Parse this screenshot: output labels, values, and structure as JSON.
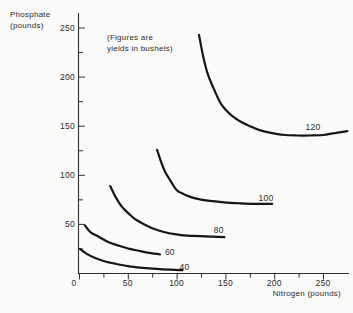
{
  "background": "#fbfbf9",
  "colors": {
    "curve": "#161616",
    "axis": "#2e2e2e",
    "text": "#2b2b2b"
  },
  "chart_data": {
    "type": "line",
    "annotation": [
      "(Figures are",
      "yields in bushels)"
    ],
    "x_axis": {
      "title": "Nitrogen (pounds)",
      "min": 0,
      "max": 277,
      "major_ticks": [
        0,
        50,
        100,
        150,
        200,
        250
      ],
      "minor_tick_step": 25
    },
    "y_axis": {
      "title": [
        "Phosphate",
        "(pounds)"
      ],
      "min": 0,
      "max": 265,
      "major_ticks": [
        50,
        100,
        150,
        200,
        250
      ],
      "minor_tick_step": 25
    },
    "series": [
      {
        "label": "40",
        "yield_bushels": 40,
        "label_pos": [
          103,
          3.5
        ],
        "points": [
          [
            1,
            25
          ],
          [
            8,
            20
          ],
          [
            16,
            16
          ],
          [
            26,
            12.5
          ],
          [
            37,
            10
          ],
          [
            50,
            7.5
          ],
          [
            62,
            6
          ],
          [
            83,
            4.5
          ],
          [
            106,
            3.5
          ]
        ]
      },
      {
        "label": "60",
        "yield_bushels": 60,
        "label_pos": [
          88,
          19
        ],
        "points": [
          [
            6,
            49
          ],
          [
            12,
            42
          ],
          [
            21,
            37
          ],
          [
            31,
            31.5
          ],
          [
            42,
            28
          ],
          [
            52,
            25
          ],
          [
            62,
            23
          ],
          [
            72,
            21
          ],
          [
            83,
            19.5
          ]
        ]
      },
      {
        "label": "80",
        "yield_bushels": 80,
        "label_pos": [
          138,
          41
        ],
        "points": [
          [
            32,
            89
          ],
          [
            38,
            77
          ],
          [
            44,
            68
          ],
          [
            51,
            61
          ],
          [
            58,
            55
          ],
          [
            68,
            49.5
          ],
          [
            78,
            45
          ],
          [
            88,
            42
          ],
          [
            98,
            40
          ],
          [
            111,
            38.5
          ],
          [
            124,
            38
          ],
          [
            149,
            37
          ]
        ]
      },
      {
        "label": "100",
        "yield_bushels": 100,
        "label_pos": [
          184,
          74
        ],
        "points": [
          [
            80,
            126
          ],
          [
            84,
            114
          ],
          [
            88,
            104
          ],
          [
            94,
            94
          ],
          [
            100,
            85
          ],
          [
            107,
            81
          ],
          [
            114,
            78
          ],
          [
            124,
            75.5
          ],
          [
            134,
            74
          ],
          [
            149,
            72.5
          ],
          [
            165,
            71.5
          ],
          [
            181,
            71
          ],
          [
            198,
            71
          ]
        ]
      },
      {
        "label": "120",
        "yield_bushels": 120,
        "label_pos": [
          232,
          146
        ],
        "points": [
          [
            123,
            243
          ],
          [
            127,
            222
          ],
          [
            132,
            203
          ],
          [
            139,
            186
          ],
          [
            146,
            172
          ],
          [
            155,
            162
          ],
          [
            165,
            155
          ],
          [
            175,
            150
          ],
          [
            185,
            146
          ],
          [
            198,
            143
          ],
          [
            211,
            141
          ],
          [
            224,
            140.5
          ],
          [
            236,
            140.5
          ],
          [
            250,
            141
          ],
          [
            262,
            143
          ],
          [
            275,
            145
          ]
        ]
      }
    ]
  }
}
